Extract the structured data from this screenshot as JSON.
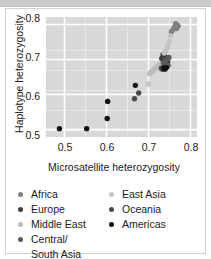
{
  "figure": {
    "background": "#ffffff",
    "panel_background": "#d8d8d8",
    "grid_color": "#ffffff"
  },
  "chart_data": {
    "type": "scatter",
    "title": "",
    "xlabel": "Microsatellite heterozygosity",
    "ylabel": "Haplotype heterozygosity",
    "xlim": [
      0.455,
      0.815
    ],
    "ylim": [
      0.468,
      0.812
    ],
    "xticks": [
      0.5,
      0.6,
      0.7,
      0.8
    ],
    "xtick_labels": [
      "0.5",
      "0.6",
      "0.7",
      "0.8"
    ],
    "yticks": [
      0.5,
      0.6,
      0.7,
      0.8
    ],
    "ytick_labels": [
      "0.5",
      "0.6",
      "0.7",
      "0.8"
    ],
    "grid": true,
    "minor_grid": true,
    "legend_position": "below",
    "series": [
      {
        "name": "Africa",
        "color": "#808080",
        "points": [
          [
            0.764,
            0.793
          ],
          [
            0.767,
            0.789
          ],
          [
            0.77,
            0.786
          ],
          [
            0.761,
            0.782
          ],
          [
            0.758,
            0.776
          ],
          [
            0.766,
            0.779
          ],
          [
            0.754,
            0.77
          ]
        ]
      },
      {
        "name": "Europe",
        "color": "#3d3d3d",
        "points": [
          [
            0.734,
            0.704
          ],
          [
            0.737,
            0.7
          ],
          [
            0.74,
            0.697
          ],
          [
            0.731,
            0.693
          ],
          [
            0.742,
            0.69
          ],
          [
            0.736,
            0.686
          ],
          [
            0.745,
            0.684
          ],
          [
            0.739,
            0.681
          ],
          [
            0.733,
            0.678
          ]
        ]
      },
      {
        "name": "Middle East",
        "color": "#bcbcbc",
        "points": [
          [
            0.726,
            0.676
          ],
          [
            0.722,
            0.672
          ],
          [
            0.718,
            0.668
          ],
          [
            0.714,
            0.663
          ],
          [
            0.71,
            0.658
          ],
          [
            0.706,
            0.655
          ],
          [
            0.702,
            0.65
          ]
        ]
      },
      {
        "name": "Central/South Asia",
        "color": "#5a5a5a",
        "points": [
          [
            0.744,
            0.692
          ],
          [
            0.748,
            0.696
          ],
          [
            0.741,
            0.688
          ],
          [
            0.738,
            0.683
          ],
          [
            0.735,
            0.68
          ],
          [
            0.746,
            0.673
          ],
          [
            0.743,
            0.67
          ]
        ]
      },
      {
        "name": "East Asia",
        "color": "#c4c4c4",
        "points": [
          [
            0.752,
            0.758
          ],
          [
            0.749,
            0.742
          ],
          [
            0.746,
            0.73
          ],
          [
            0.743,
            0.722
          ],
          [
            0.74,
            0.714
          ],
          [
            0.737,
            0.709
          ],
          [
            0.728,
            0.661
          ],
          [
            0.7,
            0.62
          ]
        ]
      },
      {
        "name": "Oceania",
        "color": "#4a4a4a",
        "points": [
          [
            0.666,
            0.578
          ],
          [
            0.676,
            0.594
          ],
          [
            0.73,
            0.665
          ],
          [
            0.733,
            0.662
          ]
        ]
      },
      {
        "name": "Americas",
        "color": "#111111",
        "points": [
          [
            0.487,
            0.492
          ],
          [
            0.552,
            0.492
          ],
          [
            0.601,
            0.521
          ],
          [
            0.602,
            0.57
          ],
          [
            0.668,
            0.616
          ],
          [
            0.736,
            0.666
          ],
          [
            0.739,
            0.663
          ],
          [
            0.742,
            0.667
          ]
        ]
      }
    ]
  },
  "legend": {
    "columns": [
      {
        "items": [
          {
            "label": "Africa",
            "color": "#808080"
          },
          {
            "label": "Europe",
            "color": "#3d3d3d"
          },
          {
            "label": "Middle East",
            "color": "#bcbcbc"
          },
          {
            "label": "Central/",
            "color": "#5a5a5a",
            "label2": "South Asia"
          }
        ]
      },
      {
        "items": [
          {
            "label": "East Asia",
            "color": "#c4c4c4"
          },
          {
            "label": "Oceania",
            "color": "#4a4a4a"
          },
          {
            "label": "Americas",
            "color": "#111111"
          }
        ]
      }
    ]
  }
}
